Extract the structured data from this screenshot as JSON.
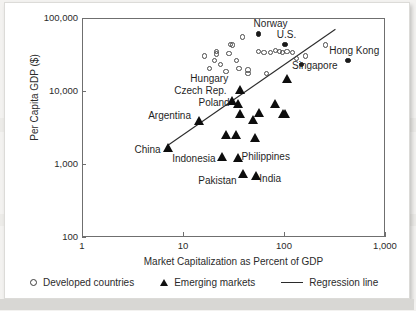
{
  "chart_data": {
    "type": "scatter",
    "title": "",
    "xlabel": "Market Capitalization as Percent of GDP",
    "ylabel": "Per Capita GDP ($)",
    "xscale": "log",
    "yscale": "log",
    "xlim": [
      1,
      1000
    ],
    "ylim": [
      100,
      100000
    ],
    "xticks": [
      "1",
      "10",
      "100",
      "1,000"
    ],
    "xtick_values": [
      1,
      10,
      100,
      1000
    ],
    "yticks": [
      "100",
      "1,000",
      "10,000",
      "100,000"
    ],
    "ytick_values": [
      100,
      1000,
      10000,
      100000
    ],
    "grid": false,
    "legend_position": "bottom",
    "legend": [
      {
        "marker": "open-circle",
        "label": "Developed countries"
      },
      {
        "marker": "filled-triangle",
        "label": "Emerging markets"
      },
      {
        "marker": "line",
        "label": "Regression line"
      }
    ],
    "series": [
      {
        "name": "Developed countries",
        "marker": "open-circle",
        "points": [
          {
            "x": 20,
            "y": 27000
          },
          {
            "x": 21,
            "y": 33000
          },
          {
            "x": 21,
            "y": 36000
          },
          {
            "x": 16,
            "y": 31000
          },
          {
            "x": 18,
            "y": 21000
          },
          {
            "x": 23,
            "y": 24000
          },
          {
            "x": 26,
            "y": 19000
          },
          {
            "x": 28,
            "y": 34000
          },
          {
            "x": 29,
            "y": 45000
          },
          {
            "x": 30,
            "y": 44000
          },
          {
            "x": 33,
            "y": 27000
          },
          {
            "x": 35,
            "y": 21000
          },
          {
            "x": 38,
            "y": 57000
          },
          {
            "x": 43,
            "y": 18000
          },
          {
            "x": 43,
            "y": 20000
          },
          {
            "x": 55,
            "y": 36000
          },
          {
            "x": 62,
            "y": 35000
          },
          {
            "x": 66,
            "y": 18000
          },
          {
            "x": 72,
            "y": 35000
          },
          {
            "x": 80,
            "y": 37000
          },
          {
            "x": 88,
            "y": 36000
          },
          {
            "x": 95,
            "y": 35000
          },
          {
            "x": 105,
            "y": 36000
          },
          {
            "x": 118,
            "y": 35000
          },
          {
            "x": 130,
            "y": 29000
          },
          {
            "x": 160,
            "y": 31000
          },
          {
            "x": 250,
            "y": 44000
          }
        ]
      },
      {
        "name": "Emerging markets",
        "marker": "filled-triangle",
        "points": [
          {
            "x": 7,
            "y": 1750,
            "label": "China"
          },
          {
            "x": 14,
            "y": 4100,
            "label": "Argentina"
          },
          {
            "x": 24,
            "y": 1300,
            "label": "Indonesia"
          },
          {
            "x": 26,
            "y": 2600,
            "label": ""
          },
          {
            "x": 30,
            "y": 7700,
            "label": "Czech Rep."
          },
          {
            "x": 33,
            "y": 2600,
            "label": ""
          },
          {
            "x": 34,
            "y": 7000,
            "label": "Poland"
          },
          {
            "x": 34,
            "y": 1250,
            "label": "Philippines"
          },
          {
            "x": 36,
            "y": 10800,
            "label": "Hungary"
          },
          {
            "x": 36,
            "y": 5000,
            "label": ""
          },
          {
            "x": 38,
            "y": 760,
            "label": "Pakistan"
          },
          {
            "x": 48,
            "y": 4200,
            "label": ""
          },
          {
            "x": 50,
            "y": 2400,
            "label": ""
          },
          {
            "x": 52,
            "y": 720,
            "label": "India"
          },
          {
            "x": 55,
            "y": 5200,
            "label": ""
          },
          {
            "x": 80,
            "y": 7000,
            "label": ""
          },
          {
            "x": 95,
            "y": 5000,
            "label": ""
          },
          {
            "x": 100,
            "y": 5000,
            "label": ""
          },
          {
            "x": 105,
            "y": 15500,
            "label": ""
          }
        ]
      },
      {
        "name": "Highlighted",
        "marker": "filled-circle",
        "points": [
          {
            "x": 100,
            "y": 45000,
            "label": "U.S."
          },
          {
            "x": 420,
            "y": 27000,
            "label": "Hong Kong"
          },
          {
            "x": 145,
            "y": 24000,
            "label": "Singapore"
          },
          {
            "x": 55,
            "y": 62000,
            "label": "Norway"
          }
        ]
      }
    ],
    "regression_line": {
      "from": {
        "x": 7,
        "y": 1800
      },
      "to": {
        "x": 330,
        "y": 72000
      }
    },
    "annotations": [
      {
        "text": "Norway",
        "x": 50,
        "y": 80000,
        "align": "left"
      },
      {
        "text": "U.S.",
        "x": 85,
        "y": 56000,
        "align": "left"
      },
      {
        "text": "Hong Kong",
        "x": 280,
        "y": 34000,
        "align": "left"
      },
      {
        "text": "Singapore",
        "x": 120,
        "y": 21000,
        "align": "left"
      },
      {
        "text": "Hungary",
        "x": 28,
        "y": 14000,
        "align": "right"
      },
      {
        "text": "Czech Rep.",
        "x": 27,
        "y": 9600,
        "align": "right"
      },
      {
        "text": "Poland",
        "x": 29,
        "y": 6600,
        "align": "right"
      },
      {
        "text": "Argentina",
        "x": 12,
        "y": 4400,
        "align": "right"
      },
      {
        "text": "China",
        "x": 6,
        "y": 1500,
        "align": "right"
      },
      {
        "text": "Indonesia",
        "x": 21,
        "y": 1150,
        "align": "right"
      },
      {
        "text": "Philippines",
        "x": 38,
        "y": 1200,
        "align": "left"
      },
      {
        "text": "Pakistan",
        "x": 34,
        "y": 560,
        "align": "right"
      },
      {
        "text": "India",
        "x": 57,
        "y": 600,
        "align": "left"
      }
    ]
  },
  "figure": {
    "ylabel": "Per Capita GDP ($)",
    "xlabel": "Market Capitalization as Percent of GDP",
    "yticks": [
      "100,000",
      "10,000",
      "1,000",
      "100"
    ],
    "xticks": [
      "1",
      "10",
      "100",
      "1,000"
    ],
    "legend": {
      "developed": "Developed countries",
      "emerging": "Emerging markets",
      "regression": "Regression line"
    }
  }
}
